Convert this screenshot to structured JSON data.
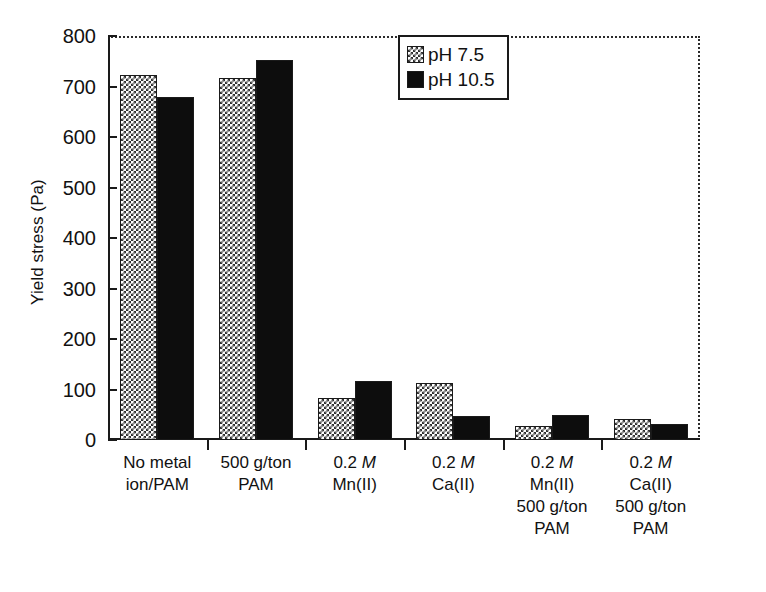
{
  "chart_data": {
    "type": "bar",
    "title": "",
    "xlabel": "",
    "ylabel": "Yield stress (Pa)",
    "ylim": [
      0,
      800
    ],
    "ytick_values": [
      0,
      100,
      200,
      300,
      400,
      500,
      600,
      700,
      800
    ],
    "ytick_labels": [
      "0",
      "100",
      "200",
      "300",
      "400",
      "500",
      "600",
      "700",
      "800"
    ],
    "grid": false,
    "legend_position": "upper right",
    "categories": [
      "No metal ion/PAM",
      "500 g/ton PAM",
      "0.2 M Mn(II)",
      "0.2 M Ca(II)",
      "0.2 M Mn(II) 500 g/ton PAM",
      "0.2 M Ca(II) 500 g/ton PAM"
    ],
    "category_lines": [
      [
        "No metal",
        "ion/PAM"
      ],
      [
        "500 g/ton",
        "PAM"
      ],
      [
        "0.2 M",
        "Mn(II)"
      ],
      [
        "0.2 M",
        "Ca(II)"
      ],
      [
        "0.2 M",
        "Mn(II)",
        "500 g/ton",
        "PAM"
      ],
      [
        "0.2 M",
        "Ca(II)",
        "500 g/ton",
        "PAM"
      ]
    ],
    "series": [
      {
        "name": "pH 7.5",
        "pattern": "checker",
        "color": "#303030",
        "values": [
          723,
          717,
          84,
          113,
          27,
          42
        ]
      },
      {
        "name": "pH 10.5",
        "pattern": "solid",
        "color": "#0d0d0d",
        "values": [
          680,
          752,
          117,
          47,
          50,
          32
        ]
      }
    ]
  },
  "legend": {
    "entries": [
      {
        "label": "pH 7.5",
        "swatch": "checker-swatch"
      },
      {
        "label": "pH 10.5",
        "swatch": "solid-swatch"
      }
    ]
  },
  "axes": {
    "y_title": "Yield stress (Pa)"
  }
}
